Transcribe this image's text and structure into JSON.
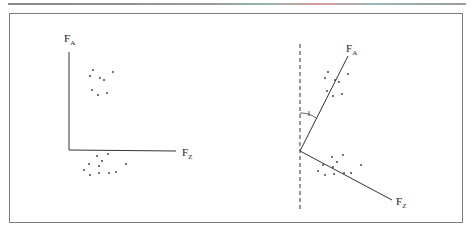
{
  "figure": {
    "type": "factor-rotation-diagram",
    "left_panel": {
      "description": "Unrotated orthogonal factor axes",
      "axes": {
        "vertical": {
          "label": "F",
          "subscript": "A"
        },
        "horizontal": {
          "label": "F",
          "subscript": "Z"
        }
      },
      "clusters": [
        "upper cluster near F_A axis",
        "lower cluster below F_Z axis"
      ]
    },
    "right_panel": {
      "description": "Rotated oblique factor axes with dashed reference line and marked angle",
      "axes": {
        "upper": {
          "label": "F",
          "subscript": "A"
        },
        "lower": {
          "label": "F",
          "subscript": "Z"
        }
      },
      "reference_line": "dashed vertical",
      "angle_marker": "arc between dashed line and F_A axis"
    }
  },
  "colors": {
    "line": "#333333",
    "frame": "#7a7a7a",
    "dot": "#333333"
  }
}
